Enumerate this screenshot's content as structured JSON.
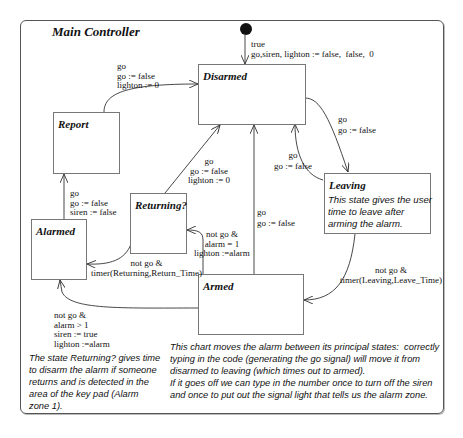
{
  "chart": {
    "title": "Main Controller",
    "initial": {
      "label": "true\ngo,siren, lighton := false,  false,  0"
    },
    "states": [
      {
        "id": "disarmed",
        "name": "Disarmed",
        "description": ""
      },
      {
        "id": "report",
        "name": "Report",
        "description": ""
      },
      {
        "id": "returning",
        "name": "Returning?",
        "description": ""
      },
      {
        "id": "alarmed",
        "name": "Alarmed",
        "description": ""
      },
      {
        "id": "leaving",
        "name": "Leaving",
        "description": "This state gives the user\ntime to leave after\narming the alarm."
      },
      {
        "id": "armed",
        "name": "Armed",
        "description": ""
      }
    ],
    "transitions": [
      {
        "from": "report",
        "to": "disarmed",
        "label": "go\ngo := false\nlighton := 0"
      },
      {
        "from": "disarmed",
        "to": "leaving",
        "label": "go\ngo := false"
      },
      {
        "from": "leaving",
        "to": "disarmed",
        "label": "go\ngo := false"
      },
      {
        "from": "returning",
        "to": "disarmed",
        "label": "go\ngo := false\nlighton := 0"
      },
      {
        "from": "armed",
        "to": "disarmed",
        "label": "go\ngo := false"
      },
      {
        "from": "alarmed",
        "to": "report",
        "label": "go\ngo := false\nsiren := false"
      },
      {
        "from": "armed",
        "to": "returning",
        "label": "not go &\nalarm = 1\nlighton :=alarm"
      },
      {
        "from": "returning",
        "to": "alarmed",
        "label": "not go &\ntimer(Returning,Return_Time)"
      },
      {
        "from": "leaving",
        "to": "armed",
        "label": "not go &\ntimer(Leaving,Leave_Time)"
      },
      {
        "from": "armed",
        "to": "alarmed",
        "label": "not go &\nalarm > 1\nsiren := true\nlighton :=alarm"
      }
    ],
    "notes": [
      "The state Returning? gives time\nto disarm the alarm if someone\nreturns and is detected in the\narea of the key pad (Alarm\nzone 1).",
      "This chart moves the alarm between its principal states:  correctly\ntyping in the code (generating the go signal) will move it from\ndisarmed to leaving (which times out to armed).\nIf it goes off we can type in the number once to turn off the siren\nand once to put out the signal light that tells us the alarm zone."
    ]
  }
}
